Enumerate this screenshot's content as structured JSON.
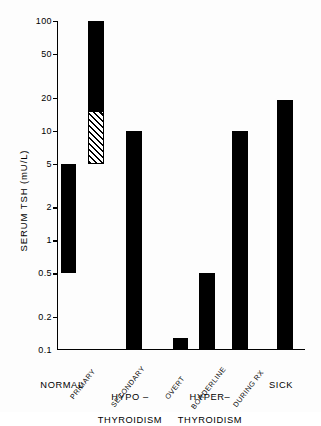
{
  "chart_data": {
    "type": "bar",
    "title": "",
    "subtitle": "",
    "xlabel": "",
    "ylabel": "SERUM TSH (mU/L)",
    "yscale": "log",
    "ylim": [
      0.1,
      100
    ],
    "grid": false,
    "legend": "none",
    "y_ticks": [
      {
        "value": 100,
        "label": "100"
      },
      {
        "value": 50,
        "label": "50"
      },
      {
        "value": 20,
        "label": "20"
      },
      {
        "value": 10,
        "label": "10"
      },
      {
        "value": 5,
        "label": "5"
      },
      {
        "value": 2,
        "label": "2"
      },
      {
        "value": 1,
        "label": "1"
      },
      {
        "value": 0.5,
        "label": "0.5"
      },
      {
        "value": 0.2,
        "label": "0.2"
      },
      {
        "value": 0.1,
        "label": "0.1"
      }
    ],
    "categories": [
      "",
      "PRIMARY",
      "SECONDARY",
      "OVERT",
      "BORDERLINE",
      "DURING RX",
      ""
    ],
    "bars": [
      {
        "category": "",
        "group": "NORMAL",
        "low": 0.5,
        "high": 5,
        "fill": "solid"
      },
      {
        "category": "PRIMARY",
        "group": "HYPO-THYROIDISM",
        "low": 5,
        "high": 15,
        "fill": "hatched"
      },
      {
        "category": "PRIMARY",
        "group": "HYPO-THYROIDISM",
        "low": 15,
        "high": 100,
        "fill": "solid"
      },
      {
        "category": "SECONDARY",
        "group": "HYPO-THYROIDISM",
        "low": 0.1,
        "high": 10,
        "fill": "solid"
      },
      {
        "category": "OVERT",
        "group": "HYPER-THYROIDISM",
        "low": 0.1,
        "high": 0.13,
        "fill": "solid"
      },
      {
        "category": "BORDERLINE",
        "group": "HYPER-THYROIDISM",
        "low": 0.1,
        "high": 0.5,
        "fill": "solid"
      },
      {
        "category": "DURING RX",
        "group": "HYPER-THYROIDISM",
        "low": 0.1,
        "high": 10,
        "fill": "solid"
      },
      {
        "category": "",
        "group": "SICK",
        "low": 0.1,
        "high": 19,
        "fill": "solid"
      }
    ],
    "group_labels": [
      "NORMAL",
      "HYPO –\nTHYROIDISM",
      "HYPER–\nTHYROIDISM",
      "SICK"
    ],
    "colors": {
      "bar_fill": "#000000",
      "axis": "#000000",
      "background": "#ffffff"
    }
  },
  "ticks": {
    "t100": "100",
    "t50": "50",
    "t20": "20",
    "t10": "10",
    "t5": "5",
    "t2": "2",
    "t1": "1",
    "t05": "0.5",
    "t02": "0.2",
    "t01": "0.1"
  },
  "categories": {
    "primary": "PRIMARY",
    "secondary": "SECONDARY",
    "overt": "OVERT",
    "borderline": "BORDERLINE",
    "during_rx": "DURING RX"
  },
  "groups": {
    "normal": "NORMAL",
    "hypo_line1": "HYPO –",
    "hypo_line2": "THYROIDISM",
    "hyper_line1": "HYPER–",
    "hyper_line2": "THYROIDISM",
    "sick": "SICK"
  },
  "axis": {
    "y_title": "SERUM TSH (mU/L)"
  }
}
